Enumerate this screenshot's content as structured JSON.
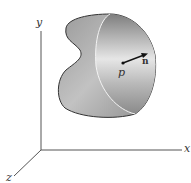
{
  "figure": {
    "axes": {
      "x_label": "x",
      "y_label": "y",
      "z_label": "z"
    },
    "point_label": "p",
    "normal_label": "n",
    "colors": {
      "axis": "#555555",
      "surface_outline": "#333333",
      "surface_fill_dark": "#8a8a8a",
      "surface_fill_light": "#e8e8e8",
      "arrow": "#111111"
    }
  }
}
